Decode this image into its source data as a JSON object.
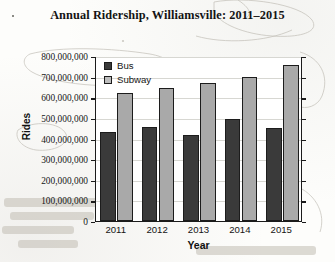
{
  "chart_data": {
    "type": "bar",
    "title": "Annual Ridership, Williamsville: 2011–2015",
    "xlabel": "Year",
    "ylabel": "Rides",
    "categories": [
      "2011",
      "2012",
      "2013",
      "2014",
      "2015"
    ],
    "series": [
      {
        "name": "Bus",
        "color": "#3a3a3a",
        "values": [
          430000000,
          455000000,
          415000000,
          495000000,
          450000000
        ]
      },
      {
        "name": "Subway",
        "color": "#a9a9a9",
        "values": [
          620000000,
          645000000,
          670000000,
          700000000,
          755000000
        ]
      }
    ],
    "ylim": [
      0,
      800000000
    ],
    "ytick_step": 100000000,
    "ytick_labels": [
      "800,000,000",
      "700,000,000",
      "600,000,000",
      "500,000,000",
      "400,000,000",
      "300,000,000",
      "200,000,000",
      "100,000,000",
      "0"
    ],
    "grid": true,
    "legend_position": "top-left-inside"
  },
  "legend": {
    "items": [
      {
        "label": "Bus"
      },
      {
        "label": "Subway"
      }
    ]
  }
}
